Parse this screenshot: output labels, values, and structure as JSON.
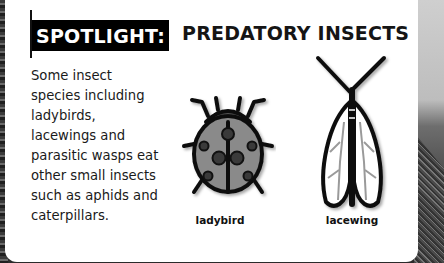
{
  "header": {
    "badge": "SPOTLIGHT:",
    "title": "PREDATORY INSECTS"
  },
  "body": {
    "lines": [
      "Some insect",
      "species including",
      "ladybirds,",
      "lacewings and",
      "parasitic wasps eat",
      "other small insects",
      "such as aphids and",
      "caterpillars."
    ]
  },
  "illustrations": [
    {
      "icon": "ladybird-icon",
      "label": "ladybird"
    },
    {
      "icon": "lacewing-icon",
      "label": "lacewing"
    }
  ],
  "colors": {
    "badge_bg": "#000000",
    "badge_text": "#ffffff",
    "card_bg": "#ffffff",
    "ladybird_body": "#8a8a8a",
    "lacewing_veins": "#9a9a9a"
  }
}
